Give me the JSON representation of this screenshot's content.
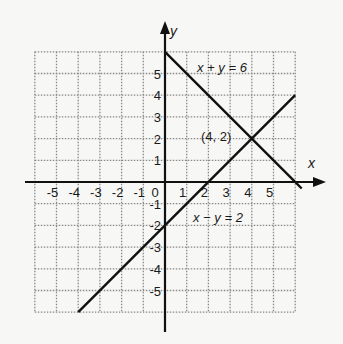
{
  "chart_data": {
    "type": "line",
    "title": "",
    "xlabel": "x",
    "ylabel": "y",
    "xlim": [
      -6,
      6
    ],
    "ylim": [
      -6,
      6
    ],
    "grid": true,
    "x_ticks": [
      "-5",
      "-4",
      "-3",
      "-2",
      "-1",
      "0",
      "1",
      "2",
      "3",
      "4",
      "5"
    ],
    "y_ticks": [
      "5",
      "4",
      "3",
      "2",
      "1",
      "-1",
      "-2",
      "-3",
      "-4",
      "-5"
    ],
    "series": [
      {
        "name": "x + y = 6",
        "points": [
          [
            0,
            6
          ],
          [
            5.8,
            0.2
          ],
          [
            6.3,
            -0.3
          ]
        ]
      },
      {
        "name": "x − y = 2",
        "points": [
          [
            -4,
            -6
          ],
          [
            6,
            4
          ]
        ]
      }
    ],
    "annotations": [
      {
        "text": "x + y = 6",
        "x": 1.8,
        "y": 5
      },
      {
        "text": "(4, 2)",
        "x": 2.1,
        "y": 2
      },
      {
        "text": "x − y = 2",
        "x": 1.2,
        "y": -1
      }
    ],
    "intersection": {
      "label": "(4, 2)",
      "x": 4,
      "y": 2
    }
  },
  "labels": {
    "x_axis": "x",
    "y_axis": "y",
    "eq1": "x + y = 6",
    "eq2": "x − y = 2",
    "point": "(4, 2)",
    "origin": "0"
  },
  "colors": {
    "line": "#111111",
    "grid": "#8a8a8a",
    "background": "#f7f7f5"
  }
}
